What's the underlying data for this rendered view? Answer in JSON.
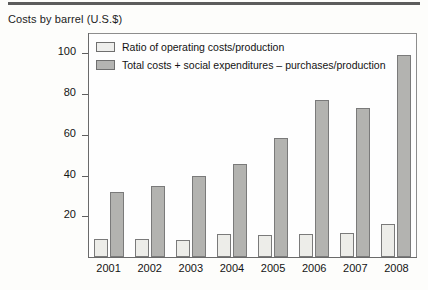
{
  "title": "Costs by barrel (U.S.$)",
  "legend": [
    {
      "key": "operating",
      "label": "Ratio of operating costs/production",
      "swatch": "light",
      "color": "#eeeeec"
    },
    {
      "key": "total",
      "label": "Total costs + social expenditures – purchases/production",
      "swatch": "dark",
      "color": "#b4b4b2"
    }
  ],
  "axis": {
    "y_ticks": [
      "20",
      "40",
      "60",
      "80",
      "100"
    ],
    "x_ticks": [
      "2001",
      "2002",
      "2003",
      "2004",
      "2005",
      "2006",
      "2007",
      "2008"
    ]
  },
  "chart_data": {
    "type": "bar",
    "title": "Costs by barrel (U.S.$)",
    "xlabel": "",
    "ylabel": "",
    "ylim": [
      0,
      110
    ],
    "yticks": [
      20,
      40,
      60,
      80,
      100
    ],
    "grid": false,
    "legend_position": "top-inside",
    "categories": [
      "2001",
      "2002",
      "2003",
      "2004",
      "2005",
      "2006",
      "2007",
      "2008"
    ],
    "series": [
      {
        "name": "Ratio of operating costs/production",
        "color": "#eeeeec",
        "values": [
          9,
          9,
          8.5,
          11.5,
          11,
          11.5,
          12,
          16
        ]
      },
      {
        "name": "Total costs + social expenditures – purchases/production",
        "color": "#b4b4b2",
        "values": [
          32,
          35,
          40,
          45.5,
          58.5,
          77,
          73,
          99
        ]
      }
    ]
  }
}
